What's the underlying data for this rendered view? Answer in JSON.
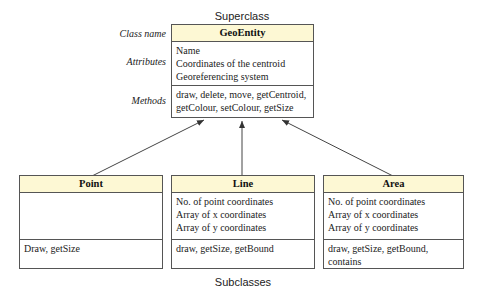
{
  "superclass_caption": "Superclass",
  "subclasses_caption": "Subclasses",
  "side_labels": {
    "class_name": "Class name",
    "attributes": "Attributes",
    "methods": "Methods"
  },
  "superclass": {
    "name": "GeoEntity",
    "attributes": [
      "Name",
      "Coordinates of the centroid",
      "Georeferencing system"
    ],
    "methods": [
      "draw, delete, move, getCentroid,",
      "getColour, setColour, getSize"
    ]
  },
  "subclasses": [
    {
      "name": "Point",
      "attributes": [],
      "methods": [
        "Draw, getSize"
      ]
    },
    {
      "name": "Line",
      "attributes": [
        "No. of point coordinates",
        "Array of x coordinates",
        "Array of y coordinates"
      ],
      "methods": [
        "draw, getSize, getBound"
      ]
    },
    {
      "name": "Area",
      "attributes": [
        "No. of point coordinates",
        "Array of x coordinates",
        "Array of y coordinates"
      ],
      "methods": [
        "draw, getSize, getBound,",
        "contains"
      ]
    }
  ],
  "colors": {
    "header_fill": "#fdf8d4",
    "border": "#555555"
  }
}
